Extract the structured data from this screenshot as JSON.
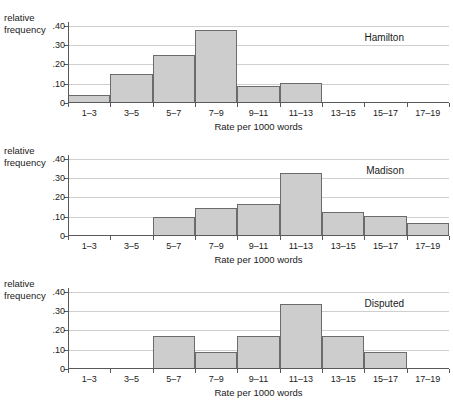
{
  "figure": {
    "axis_titles": {
      "y_line1": "relative",
      "y_line2": "frequency",
      "x": "Rate per 1000 words"
    },
    "y_ticks": [
      "0",
      ".10",
      ".20",
      ".30",
      ".40"
    ],
    "y_tick_values": [
      0,
      0.1,
      0.2,
      0.3,
      0.4
    ],
    "categories": [
      "1–3",
      "3–5",
      "5–7",
      "7–9",
      "9–11",
      "11–13",
      "13–15",
      "15–17",
      "17–19"
    ],
    "colors": {
      "bar_fill": "#cdcdcd",
      "bar_edge": "#6b6b6b",
      "axis": "#59595b",
      "grid": "#cfcfcf",
      "text": "#1a1a1a",
      "background": "#ffffff"
    }
  },
  "chart_data": [
    {
      "type": "bar",
      "title": "Hamilton",
      "xlabel": "Rate per 1000 words",
      "ylabel": "relative frequency",
      "categories": [
        "1–3",
        "3–5",
        "5–7",
        "7–9",
        "9–11",
        "11–13",
        "13–15",
        "15–17",
        "17–19"
      ],
      "values": [
        0.04,
        0.15,
        0.25,
        0.38,
        0.09,
        0.105,
        0,
        0,
        0
      ],
      "ylim": [
        0,
        0.42
      ],
      "yticks": [
        0,
        0.1,
        0.2,
        0.3,
        0.4
      ],
      "ytick_labels": [
        "0",
        ".10",
        ".20",
        ".30",
        ".40"
      ],
      "grid": true,
      "legend": "none"
    },
    {
      "type": "bar",
      "title": "Madison",
      "xlabel": "Rate per 1000 words",
      "ylabel": "relative frequency",
      "categories": [
        "1–3",
        "3–5",
        "5–7",
        "7–9",
        "9–11",
        "11–13",
        "13–15",
        "15–17",
        "17–19"
      ],
      "values": [
        0,
        0,
        0.1,
        0.145,
        0.165,
        0.325,
        0.125,
        0.105,
        0.065
      ],
      "ylim": [
        0,
        0.42
      ],
      "yticks": [
        0,
        0.1,
        0.2,
        0.3,
        0.4
      ],
      "ytick_labels": [
        "0",
        ".10",
        ".20",
        ".30",
        ".40"
      ],
      "grid": true,
      "legend": "none"
    },
    {
      "type": "bar",
      "title": "Disputed",
      "xlabel": "Rate per 1000 words",
      "ylabel": "relative frequency",
      "categories": [
        "1–3",
        "3–5",
        "5–7",
        "7–9",
        "9–11",
        "11–13",
        "13–15",
        "15–17",
        "17–19"
      ],
      "values": [
        0,
        0,
        0.17,
        0.09,
        0.17,
        0.335,
        0.17,
        0.09,
        0
      ],
      "ylim": [
        0,
        0.42
      ],
      "yticks": [
        0,
        0.1,
        0.2,
        0.3,
        0.4
      ],
      "ytick_labels": [
        "0",
        ".10",
        ".20",
        ".30",
        ".40"
      ],
      "grid": true,
      "legend": "none"
    }
  ]
}
